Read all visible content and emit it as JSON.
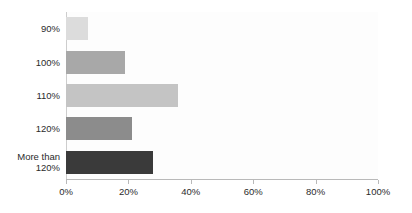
{
  "chart_data": {
    "type": "bar",
    "orientation": "horizontal",
    "title": "",
    "subtitle": "",
    "xlabel": "",
    "ylabel": "",
    "categories": [
      "90%",
      "100%",
      "110%",
      "120%",
      "More than\n120%"
    ],
    "values": [
      7,
      19,
      36,
      21,
      28
    ],
    "bar_colors": [
      "#dcdcdc",
      "#a8a8a8",
      "#c4c4c4",
      "#8c8c8c",
      "#3a3a3a"
    ],
    "xlim": [
      0,
      100
    ],
    "xticks": [
      0,
      20,
      40,
      60,
      80,
      100
    ],
    "xtick_labels": [
      "0%",
      "20%",
      "40%",
      "60%",
      "80%",
      "100%"
    ],
    "grid": false,
    "legend": null,
    "annotations": []
  },
  "colors": {
    "background": "#ffffff",
    "plot_background": "#fdfdfd",
    "axis_line": "#b9b9b9",
    "text": "#2b2b2b"
  }
}
